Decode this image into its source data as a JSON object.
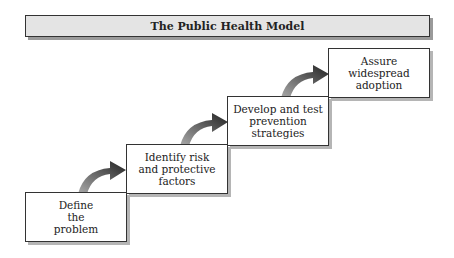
{
  "title": "The Public Health Model",
  "steps": [
    {
      "label": "Define\nthe\nproblem"
    },
    {
      "label": "Identify risk\nand protective\nfactors"
    },
    {
      "label": "Develop and test\nprevention\nstrategies"
    },
    {
      "label": "Assure\nwidespread\nadoption"
    }
  ],
  "colors": {
    "arrow_dark": "#222222",
    "arrow_light": "#9a9a9a",
    "title_bg": "#e4e4e4"
  }
}
